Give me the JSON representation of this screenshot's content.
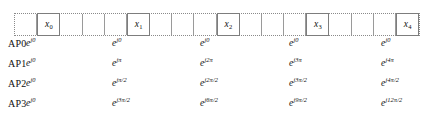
{
  "figure": {
    "type": "subcarrier-phase-table",
    "grid": {
      "total_cells": 16,
      "cells": [
        {
          "index": 0,
          "label": "",
          "pilot": false
        },
        {
          "index": 1,
          "label": "x",
          "sub": "0",
          "pilot": true
        },
        {
          "index": 2,
          "label": "",
          "pilot": false
        },
        {
          "index": 3,
          "label": "",
          "pilot": false
        },
        {
          "index": 4,
          "label": "",
          "pilot": false
        },
        {
          "index": 5,
          "label": "x",
          "sub": "1",
          "pilot": true
        },
        {
          "index": 6,
          "label": "",
          "pilot": false
        },
        {
          "index": 7,
          "label": "",
          "pilot": false
        },
        {
          "index": 8,
          "label": "",
          "pilot": false
        },
        {
          "index": 9,
          "label": "x",
          "sub": "2",
          "pilot": true
        },
        {
          "index": 10,
          "label": "",
          "pilot": false
        },
        {
          "index": 11,
          "label": "",
          "pilot": false
        },
        {
          "index": 12,
          "label": "",
          "pilot": false
        },
        {
          "index": 13,
          "label": "x",
          "sub": "3",
          "pilot": true
        },
        {
          "index": 14,
          "label": "",
          "pilot": false
        },
        {
          "index": 15,
          "label": "",
          "pilot": false
        },
        {
          "index": 16,
          "label": "",
          "pilot": false
        },
        {
          "index": 17,
          "label": "x",
          "sub": "4",
          "pilot": true
        }
      ]
    },
    "rows": [
      {
        "name": "AP0",
        "values": [
          {
            "base": "e",
            "exp": "j0"
          },
          {
            "base": "e",
            "exp": "j0"
          },
          {
            "base": "e",
            "exp": "j0"
          },
          {
            "base": "e",
            "exp": "j0"
          },
          {
            "base": "e",
            "exp": "j0"
          }
        ]
      },
      {
        "name": "AP1",
        "values": [
          {
            "base": "e",
            "exp": "j0"
          },
          {
            "base": "e",
            "exp": "jπ"
          },
          {
            "base": "e",
            "exp": "j2π"
          },
          {
            "base": "e",
            "exp": "j3π"
          },
          {
            "base": "e",
            "exp": "j4π"
          }
        ]
      },
      {
        "name": "AP2",
        "values": [
          {
            "base": "e",
            "exp": "j0"
          },
          {
            "base": "e",
            "exp": "jπ/2"
          },
          {
            "base": "e",
            "exp": "j2π/2"
          },
          {
            "base": "e",
            "exp": "j3π/2"
          },
          {
            "base": "e",
            "exp": "j4π/2"
          }
        ]
      },
      {
        "name": "AP3",
        "values": [
          {
            "base": "e",
            "exp": "j3π/2"
          },
          {
            "base": "e",
            "exp": "j3π/2"
          },
          {
            "base": "e",
            "exp": "j6π/2"
          },
          {
            "base": "e",
            "exp": "j9π/2"
          },
          {
            "base": "e",
            "exp": "j12π/2"
          }
        ]
      }
    ],
    "row_first_value_override": [
      {
        "row": 3,
        "exp": "j0"
      }
    ],
    "column_x_positions": [
      26,
      112,
      200,
      289,
      381
    ],
    "colors": {
      "text": "#111111",
      "cell_border": "#7d7d7d",
      "grid_outline": "#8a8a8a",
      "background": "#ffffff"
    }
  }
}
